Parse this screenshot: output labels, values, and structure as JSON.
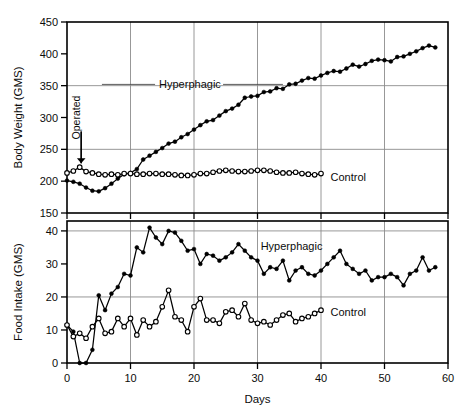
{
  "figure": {
    "background": "#ffffff",
    "line_color": "#000000",
    "grid_color": "#8c8c8c"
  },
  "chart_data": [
    {
      "type": "line",
      "panel": "top",
      "title": "",
      "xlabel": "",
      "ylabel": "Body Weight (GMS)",
      "xlim": [
        0,
        60
      ],
      "ylim": [
        150,
        450
      ],
      "xticks": [
        0,
        10,
        20,
        30,
        40,
        50,
        60
      ],
      "xtick_labels": [
        "0",
        "10",
        "20",
        "30",
        "40",
        "50",
        "60"
      ],
      "yticks": [
        150,
        200,
        250,
        300,
        350,
        400,
        450
      ],
      "ytick_labels": [
        "150",
        "200",
        "250",
        "300",
        "350",
        "400",
        "450"
      ],
      "grid": "both, at y=250 and y=350, x every 10",
      "grid_x": [
        10,
        20,
        30,
        40,
        50
      ],
      "grid_y": [
        250,
        350
      ],
      "legend_position": "inline annotations on curves",
      "annotations": [
        {
          "text": "Operated",
          "x_day": 2.0,
          "y_value": 300,
          "rotation": -90
        },
        {
          "text": "Hyperphagic",
          "x_day": 14.5,
          "y_value": 352,
          "rotation": 0
        },
        {
          "text": "Control",
          "x_day": 41.5,
          "y_value": 207,
          "rotation": 0
        }
      ],
      "series": [
        {
          "name": "Hyperphagic",
          "marker": "filled-circle",
          "x": [
            0,
            1,
            2,
            3,
            4,
            5,
            6,
            7,
            8,
            9,
            10,
            11,
            12,
            13,
            14,
            15,
            16,
            17,
            18,
            19,
            20,
            21,
            22,
            23,
            24,
            25,
            26,
            27,
            28,
            29,
            30,
            31,
            32,
            33,
            34,
            35,
            36,
            37,
            38,
            39,
            40,
            41,
            42,
            43,
            44,
            45,
            46,
            47,
            48,
            49,
            50,
            51,
            52,
            53,
            54,
            55,
            56,
            57,
            58
          ],
          "values": [
            201,
            199,
            196,
            190,
            185,
            184,
            189,
            196,
            204,
            211,
            213,
            219,
            234,
            240,
            246,
            252,
            259,
            262,
            269,
            274,
            281,
            288,
            294,
            296,
            303,
            310,
            314,
            320,
            331,
            333,
            334,
            340,
            341,
            346,
            345,
            352,
            353,
            358,
            362,
            361,
            366,
            370,
            373,
            372,
            377,
            383,
            380,
            384,
            389,
            391,
            390,
            388,
            395,
            396,
            400,
            404,
            409,
            413,
            410
          ]
        },
        {
          "name": "Control",
          "marker": "open-circle",
          "x": [
            0,
            1,
            2,
            3,
            4,
            5,
            6,
            7,
            8,
            9,
            10,
            11,
            12,
            13,
            14,
            15,
            16,
            17,
            18,
            19,
            20,
            21,
            22,
            23,
            24,
            25,
            26,
            27,
            28,
            29,
            30,
            31,
            32,
            33,
            34,
            35,
            36,
            37,
            38,
            39,
            40
          ],
          "values": [
            213,
            216,
            222,
            215,
            213,
            211,
            210,
            211,
            210,
            212,
            212,
            211,
            211,
            212,
            212,
            211,
            211,
            210,
            209,
            209,
            210,
            212,
            212,
            214,
            216,
            217,
            216,
            215,
            215,
            216,
            217,
            217,
            216,
            214,
            213,
            213,
            214,
            212,
            211,
            210,
            212
          ]
        }
      ]
    },
    {
      "type": "line",
      "panel": "bottom",
      "title": "",
      "xlabel": "Days",
      "ylabel": "Food Intake (GMS)",
      "xlim": [
        0,
        60
      ],
      "ylim": [
        0,
        43
      ],
      "xticks": [
        0,
        10,
        20,
        30,
        40,
        50,
        60
      ],
      "xtick_labels": [
        "0",
        "10",
        "20",
        "30",
        "40",
        "50",
        "60"
      ],
      "yticks": [
        0,
        10,
        20,
        30,
        40
      ],
      "ytick_labels": [
        "0",
        "10",
        "20",
        "30",
        "40"
      ],
      "grid": "both, at y=20 and y=40, x every 10",
      "grid_x": [
        10,
        20,
        30,
        40,
        50
      ],
      "grid_y": [
        20,
        40
      ],
      "legend_position": "inline annotations on curves",
      "annotations": [
        {
          "text": "Hyperphagic",
          "x_day": 30.5,
          "y_value": 35.5,
          "rotation": 0
        },
        {
          "text": "Control",
          "x_day": 41.5,
          "y_value": 15.5,
          "rotation": 0
        }
      ],
      "series": [
        {
          "name": "Hyperphagic",
          "marker": "filled-circle",
          "x": [
            0,
            1,
            2,
            3,
            4,
            5,
            6,
            7,
            8,
            9,
            10,
            11,
            12,
            13,
            14,
            15,
            16,
            17,
            18,
            19,
            20,
            21,
            22,
            23,
            24,
            25,
            26,
            27,
            28,
            29,
            30,
            31,
            32,
            33,
            34,
            35,
            36,
            37,
            38,
            39,
            40,
            41,
            42,
            43,
            44,
            45,
            46,
            47,
            48,
            49,
            50,
            51,
            52,
            53,
            54,
            55,
            56,
            57,
            58
          ],
          "values": [
            11.5,
            9.5,
            0,
            0,
            4,
            20.5,
            16,
            21,
            23,
            27,
            26.5,
            35,
            33.5,
            41,
            38,
            36,
            40,
            39.5,
            37,
            34,
            34.5,
            30,
            33,
            32.5,
            31,
            32,
            33.5,
            36,
            34,
            32,
            31,
            27,
            29,
            28.5,
            31,
            25,
            28,
            29,
            27,
            26.5,
            28,
            30,
            32,
            34,
            30,
            28.5,
            27,
            28,
            25,
            26,
            26,
            27,
            26,
            23.5,
            27,
            28,
            32,
            28,
            29
          ]
        },
        {
          "name": "Control",
          "marker": "open-circle",
          "x": [
            0,
            1,
            2,
            3,
            4,
            5,
            6,
            7,
            8,
            9,
            10,
            11,
            12,
            13,
            14,
            15,
            16,
            17,
            18,
            19,
            20,
            21,
            22,
            23,
            24,
            25,
            26,
            27,
            28,
            29,
            30,
            31,
            32,
            33,
            34,
            35,
            36,
            37,
            38,
            39,
            40
          ],
          "values": [
            11.5,
            8,
            9,
            7.5,
            11,
            13.5,
            9,
            9.5,
            13.5,
            11,
            13.5,
            8.5,
            13,
            11,
            12.5,
            17,
            22,
            14,
            13,
            9.5,
            17,
            19.5,
            13,
            13,
            12,
            15.5,
            16,
            14,
            18,
            13,
            12,
            12.5,
            11.5,
            13,
            14.5,
            15,
            12.5,
            13.5,
            14,
            15,
            16
          ]
        }
      ]
    }
  ]
}
